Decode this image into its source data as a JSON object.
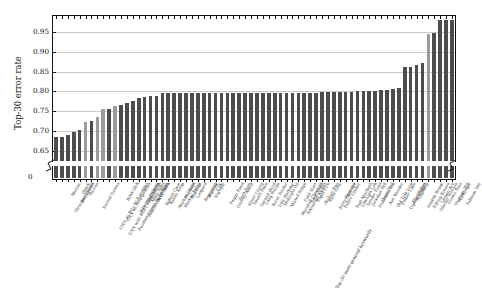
{
  "chart_data": {
    "type": "bar",
    "title": "",
    "xlabel": "Top-30 most general keywords",
    "ylabel": "Top-30 error rate",
    "ylim": [
      0.625,
      0.99
    ],
    "grid": true,
    "legend": "none",
    "axis_break": true,
    "ytick_labels": [
      "0",
      "0.65",
      "0.70",
      "0.75",
      "0.80",
      "0.85",
      "0.90",
      "0.95"
    ],
    "ytick_values": [
      0,
      0.65,
      0.7,
      0.75,
      0.8,
      0.85,
      0.9,
      0.95
    ],
    "bar_colors": {
      "primary": "#4d4d4d",
      "highlight": "#9b9b9b"
    },
    "categories": [
      "Stranger Things",
      "Maniac",
      "Bodyguard",
      "Ozark",
      "Narcos",
      "Sacred Games",
      "CNN on BG+NLP profiles",
      "CNN with BERT embeddings",
      "CNN on RGB profiles",
      "Random Forest on profiles",
      "BOW-SEA",
      "Amazon reviews",
      "RealSense reviews",
      "Lost Sierra",
      "Mike Nota",
      "MLP Neta",
      "Kubrat Case",
      "Ashen Keep",
      "Markov Chain",
      "Markov Relay",
      "Mayfield",
      "Blackout",
      "Leopard",
      "Beginning",
      "Bigelow",
      "Nightjar",
      "CSK",
      "Foggy Road",
      "Gravity Assist",
      "Zero Sum",
      "Silver Lining",
      "Desert Rose",
      "Second Wind",
      "Long Range",
      "Karst Tender",
      "Iron Harbour",
      "Midnight Oil",
      "Misted Ridge",
      "Marshall Clearing",
      "Nocturnal Ascent",
      "Cold Start",
      "Loco Motif",
      "Rapid Fire",
      "Skyline Run",
      "Slate Grey",
      "Jenny Spencer",
      "Fallen Timber",
      "Final Act",
      "Paul MacBeth",
      "Lowlight Lab",
      "Yonder Field",
      "Jackdaw Hill",
      "Pinewood Inn",
      "Omen Veil",
      "Ash Wander",
      "Old Tide Line",
      "Ember Lake",
      "Cipher Project",
      "Flint Ridge",
      "Ridgeway",
      "Shuttle Brook",
      "Filling Breeze",
      "Glacier Terrace",
      "Lumen Arc",
      "Crown Pass",
      "Vantage Hill",
      "Harbinger",
      "Tableau 360"
    ],
    "values": [
      0.685,
      0.686,
      0.691,
      0.697,
      0.702,
      0.723,
      0.726,
      0.737,
      0.756,
      0.757,
      0.764,
      0.766,
      0.771,
      0.776,
      0.784,
      0.787,
      0.788,
      0.789,
      0.795,
      0.795,
      0.796,
      0.796,
      0.797,
      0.797,
      0.797,
      0.797,
      0.797,
      0.797,
      0.797,
      0.797,
      0.797,
      0.797,
      0.797,
      0.797,
      0.797,
      0.797,
      0.797,
      0.797,
      0.797,
      0.797,
      0.797,
      0.797,
      0.797,
      0.797,
      0.797,
      0.798,
      0.798,
      0.798,
      0.798,
      0.799,
      0.799,
      0.8,
      0.8,
      0.801,
      0.802,
      0.803,
      0.804,
      0.806,
      0.81,
      0.861,
      0.861,
      0.867,
      0.871,
      0.944,
      0.948,
      0.979,
      0.979,
      0.98
    ],
    "highlight_indices": [
      5,
      7,
      8,
      10,
      63
    ]
  }
}
